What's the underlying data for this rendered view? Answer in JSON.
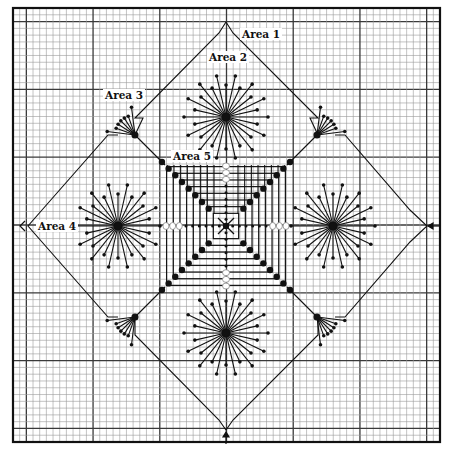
{
  "diagram": {
    "type": "needlepoint stitch chart",
    "colors": {
      "background": "#ffffff",
      "minor_grid": "#9a9a9a",
      "major_grid": "#3a3a3a",
      "ink": "#111111"
    },
    "grid": {
      "left": 13,
      "top": 8,
      "right": 440,
      "bottom": 442,
      "cells": 64,
      "major_every": 10
    },
    "center": [
      226,
      226
    ],
    "labels": [
      {
        "id": "area-1",
        "text": "Area 1",
        "x": 240,
        "y": 28
      },
      {
        "id": "area-2",
        "text": "Area 2",
        "x": 207,
        "y": 51
      },
      {
        "id": "area-3",
        "text": "Area 3",
        "x": 103,
        "y": 89
      },
      {
        "id": "area-4",
        "text": "Area 4",
        "x": 36,
        "y": 220
      },
      {
        "id": "area-5",
        "text": "Area 5",
        "x": 171,
        "y": 150
      }
    ],
    "stars": [
      {
        "name": "star-top",
        "cx": 226,
        "cy": 117
      },
      {
        "name": "star-left",
        "cx": 118,
        "cy": 226
      },
      {
        "name": "star-right",
        "cx": 333,
        "cy": 226
      },
      {
        "name": "star-bottom",
        "cx": 226,
        "cy": 333
      }
    ],
    "fans": [
      {
        "name": "fan-top-left",
        "cx": 135,
        "cy": 135,
        "dir": [
          -1,
          -1
        ]
      },
      {
        "name": "fan-top-right",
        "cx": 317,
        "cy": 135,
        "dir": [
          1,
          -1
        ]
      },
      {
        "name": "fan-bottom-left",
        "cx": 135,
        "cy": 317,
        "dir": [
          -1,
          1
        ]
      },
      {
        "name": "fan-bottom-right",
        "cx": 317,
        "cy": 317,
        "dir": [
          1,
          1
        ]
      }
    ],
    "arrows": [
      {
        "name": "arrow-left",
        "x": 20,
        "y": 226,
        "dir": "left",
        "style": "chevron"
      },
      {
        "name": "arrow-right",
        "x": 432,
        "y": 226,
        "dir": "left",
        "style": "solid"
      },
      {
        "name": "arrow-bottom",
        "x": 226,
        "y": 436,
        "dir": "up",
        "style": "solid"
      }
    ]
  }
}
